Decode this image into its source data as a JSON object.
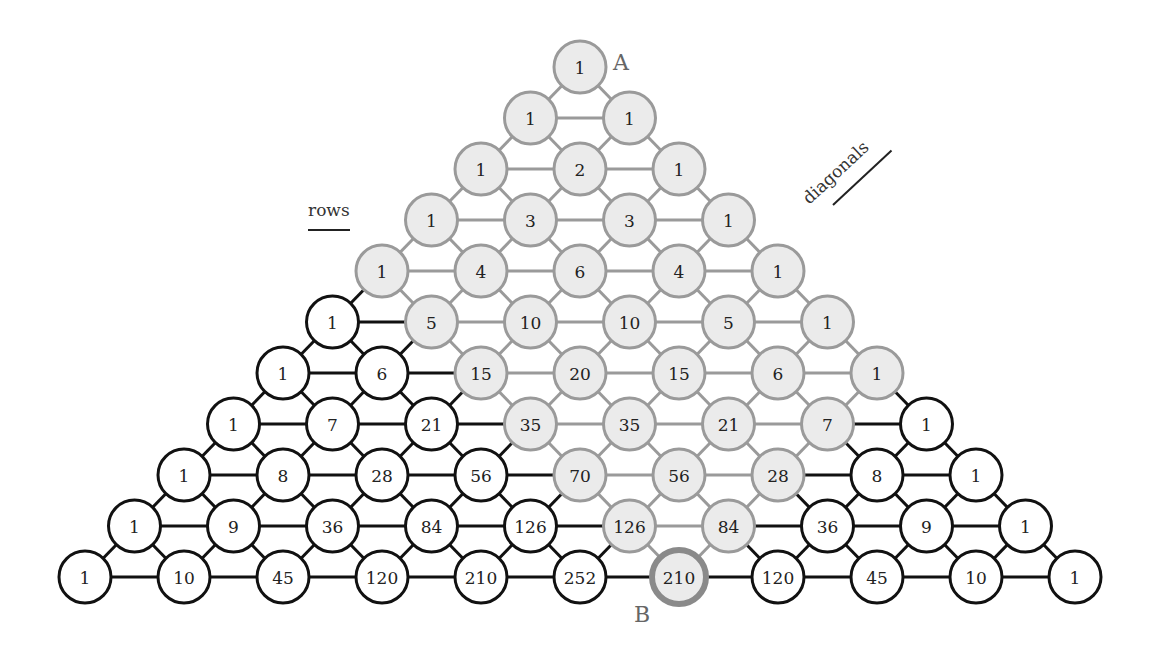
{
  "labels": {
    "rows": "rows",
    "diagonals": "diagonals",
    "point_a": "A",
    "point_b": "B"
  },
  "colors": {
    "highlight_fill": "#ebebeb",
    "highlight_stroke": "#9a9a9a",
    "plain_fill": "#ffffff",
    "plain_stroke": "#111111",
    "target_stroke": "#8a8a8a"
  },
  "triangle": {
    "rows": [
      [
        1
      ],
      [
        1,
        1
      ],
      [
        1,
        2,
        1
      ],
      [
        1,
        3,
        3,
        1
      ],
      [
        1,
        4,
        6,
        4,
        1
      ],
      [
        1,
        5,
        10,
        10,
        5,
        1
      ],
      [
        1,
        6,
        15,
        20,
        15,
        6,
        1
      ],
      [
        1,
        7,
        21,
        35,
        35,
        21,
        7,
        1
      ],
      [
        1,
        8,
        28,
        56,
        70,
        56,
        28,
        8,
        1
      ],
      [
        1,
        9,
        36,
        84,
        126,
        126,
        84,
        36,
        9,
        1
      ],
      [
        1,
        10,
        45,
        120,
        210,
        252,
        210,
        120,
        45,
        10,
        1
      ]
    ],
    "highlight_region": {
      "max_right_index": 6,
      "max_left_index": 4
    },
    "target": {
      "row": 10,
      "index": 6,
      "value": 210
    },
    "apex": {
      "row": 0,
      "index": 0,
      "value": 1
    }
  }
}
